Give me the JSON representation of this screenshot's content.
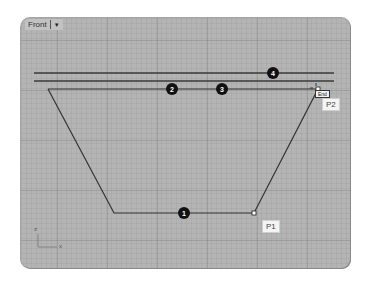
{
  "viewport": {
    "title": "Front",
    "menu_icon": "chevron-down-icon"
  },
  "callouts": [
    {
      "id": "1",
      "label": "1"
    },
    {
      "id": "2",
      "label": "2"
    },
    {
      "id": "3",
      "label": "3"
    },
    {
      "id": "4",
      "label": "4"
    }
  ],
  "points": {
    "p1": "P1",
    "p2": "P2"
  },
  "osnap_tooltip": "End",
  "axes": {
    "x": "x",
    "z": "z"
  },
  "colors": {
    "viewport_bg": "#b4b4b4",
    "curve": "#333333",
    "callout_fill": "#111111",
    "label_bg": "#f4f4f4"
  }
}
